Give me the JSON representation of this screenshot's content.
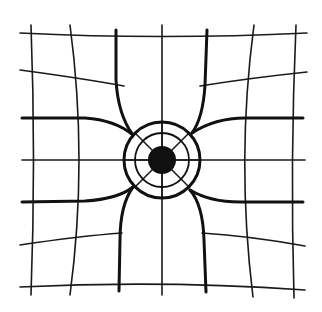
{
  "diagram": {
    "title": "",
    "colors": {
      "background": "#ffffff",
      "ink": "#111111"
    },
    "center": {
      "x": 162,
      "y": 160,
      "core_radius": 14,
      "inner_ring_radius": 27,
      "outer_ring_radius": 38
    },
    "spoke_angles_deg": [
      0,
      45,
      90,
      135,
      180,
      225,
      270,
      315
    ]
  }
}
